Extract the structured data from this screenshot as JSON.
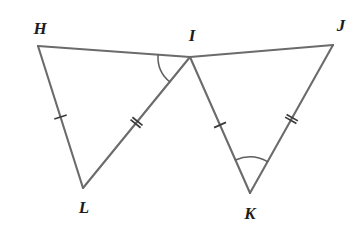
{
  "figure": {
    "width": 361,
    "height": 230,
    "background_color": "#ffffff",
    "line_color": "#6b6b6b",
    "tick_color": "#3a3a3a",
    "arc_color": "#5f5f5f",
    "label_color": "#1c1c1c"
  },
  "vertices": [
    {
      "name": "H",
      "label": "H",
      "x": 38,
      "y": 46,
      "label_x": 40,
      "label_y": 28
    },
    {
      "name": "I",
      "label": "I",
      "x": 190,
      "y": 57,
      "label_x": 192,
      "label_y": 35
    },
    {
      "name": "J",
      "label": "J",
      "x": 333,
      "y": 45,
      "label_x": 341,
      "label_y": 25
    },
    {
      "name": "L",
      "label": "L",
      "x": 83,
      "y": 188,
      "label_x": 84,
      "label_y": 207
    },
    {
      "name": "K",
      "label": "K",
      "x": 250,
      "y": 193,
      "label_x": 250,
      "label_y": 213
    }
  ],
  "segments": [
    {
      "name": "HI",
      "from": "H",
      "to": "I",
      "ticks": 0
    },
    {
      "name": "IJ",
      "from": "I",
      "to": "J",
      "ticks": 0
    },
    {
      "name": "HL",
      "from": "H",
      "to": "L",
      "ticks": 1
    },
    {
      "name": "LI",
      "from": "L",
      "to": "I",
      "ticks": 2
    },
    {
      "name": "IK",
      "from": "I",
      "to": "K",
      "ticks": 1
    },
    {
      "name": "KJ",
      "from": "K",
      "to": "J",
      "ticks": 2
    }
  ],
  "angle_marks": [
    {
      "name": "angle-HIL",
      "vertex": "I",
      "from": "H",
      "to": "L",
      "radius": 32
    },
    {
      "name": "angle-IKJ",
      "vertex": "K",
      "from": "I",
      "to": "J",
      "radius": 36
    }
  ]
}
